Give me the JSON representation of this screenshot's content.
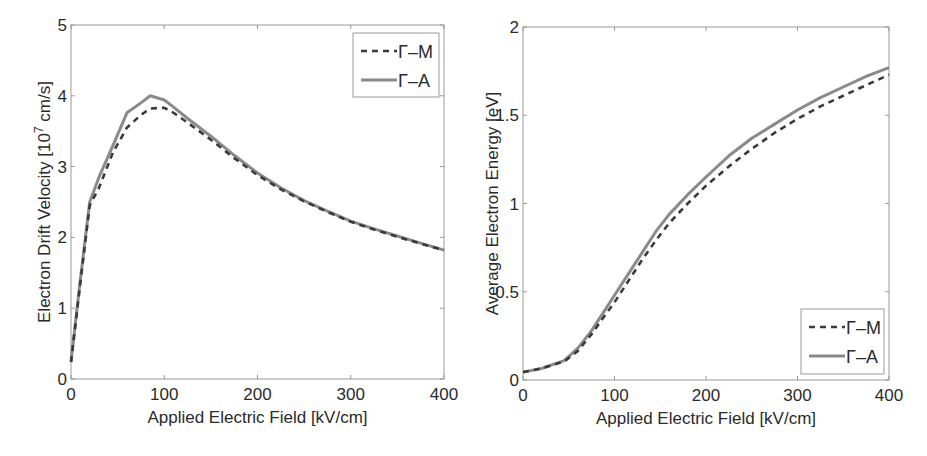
{
  "chart_data": [
    {
      "type": "line",
      "title": "",
      "xlabel": "Applied Electric Field [kV/cm]",
      "ylabel": "Electron Drift Velocity [10^7 cm/s]",
      "ylabel_parts": {
        "pre": "Electron Drift Velocity [10",
        "sup": "7",
        "post": " cm/s]"
      },
      "xlim": [
        0,
        400
      ],
      "ylim": [
        0,
        5
      ],
      "xticks": [
        0,
        100,
        200,
        300,
        400
      ],
      "yticks": [
        0,
        1,
        2,
        3,
        4,
        5
      ],
      "grid": false,
      "legend_position": "upper right",
      "series": [
        {
          "name": "Γ–M",
          "style": "dashed",
          "color": "#3a3a3a",
          "x": [
            0,
            10,
            20,
            30,
            45,
            60,
            75,
            85,
            100,
            110,
            125,
            150,
            175,
            200,
            225,
            250,
            275,
            300,
            325,
            350,
            375,
            400
          ],
          "y": [
            0.24,
            1.35,
            2.45,
            2.7,
            3.2,
            3.55,
            3.73,
            3.82,
            3.83,
            3.76,
            3.62,
            3.38,
            3.12,
            2.88,
            2.68,
            2.51,
            2.36,
            2.22,
            2.11,
            2.01,
            1.91,
            1.82
          ]
        },
        {
          "name": "Γ–A",
          "style": "solid",
          "color": "#8a8a8a",
          "x": [
            0,
            10,
            20,
            30,
            45,
            60,
            75,
            85,
            100,
            110,
            125,
            150,
            175,
            200,
            225,
            250,
            275,
            300,
            325,
            350,
            375,
            400
          ],
          "y": [
            0.24,
            1.4,
            2.5,
            2.85,
            3.3,
            3.76,
            3.9,
            4.0,
            3.94,
            3.84,
            3.68,
            3.43,
            3.16,
            2.91,
            2.7,
            2.52,
            2.37,
            2.23,
            2.12,
            2.02,
            1.92,
            1.82
          ]
        }
      ]
    },
    {
      "type": "line",
      "title": "",
      "xlabel": "Applied Electric Field [kV/cm]",
      "ylabel": "Average Electron Energy [eV]",
      "xlim": [
        0,
        400
      ],
      "ylim": [
        0,
        2
      ],
      "xticks": [
        0,
        100,
        200,
        300,
        400
      ],
      "yticks": [
        0,
        0.5,
        1,
        1.5,
        2
      ],
      "ytick_labels": [
        "0",
        "0.5",
        "1",
        "1.5",
        "2"
      ],
      "grid": false,
      "legend_position": "lower right",
      "series": [
        {
          "name": "Γ–M",
          "style": "dashed",
          "color": "#3a3a3a",
          "x": [
            0,
            20,
            45,
            60,
            75,
            90,
            100,
            115,
            130,
            145,
            160,
            180,
            200,
            225,
            250,
            275,
            300,
            325,
            350,
            375,
            400
          ],
          "y": [
            0.045,
            0.065,
            0.105,
            0.165,
            0.26,
            0.37,
            0.44,
            0.56,
            0.68,
            0.79,
            0.89,
            1.0,
            1.1,
            1.21,
            1.31,
            1.4,
            1.48,
            1.55,
            1.61,
            1.67,
            1.73
          ]
        },
        {
          "name": "Γ–A",
          "style": "solid",
          "color": "#8a8a8a",
          "x": [
            0,
            20,
            45,
            60,
            75,
            90,
            100,
            115,
            130,
            145,
            160,
            180,
            200,
            225,
            250,
            275,
            300,
            325,
            350,
            375,
            400
          ],
          "y": [
            0.045,
            0.065,
            0.11,
            0.18,
            0.28,
            0.4,
            0.48,
            0.6,
            0.72,
            0.84,
            0.94,
            1.05,
            1.15,
            1.27,
            1.37,
            1.45,
            1.53,
            1.6,
            1.66,
            1.72,
            1.77
          ]
        }
      ]
    }
  ],
  "plots": [
    {
      "box": {
        "left": 71,
        "top": 25,
        "right": 444,
        "bottom": 379
      },
      "legend": {
        "left": 353,
        "top": 33,
        "width": 86,
        "height": 64
      },
      "ylabel_x": 44,
      "ytick_decimals": 0
    },
    {
      "box": {
        "left": 523,
        "top": 27,
        "right": 889,
        "bottom": 380
      },
      "legend": {
        "left": 801,
        "top": 309,
        "width": 83,
        "height": 65
      },
      "ylabel_x": 492,
      "ytick_decimals": 1
    }
  ]
}
